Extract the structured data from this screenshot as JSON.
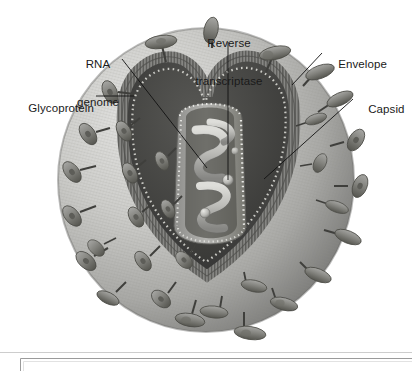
{
  "figure": {
    "name": "virus-structure-diagram",
    "background_color": "#ffffff",
    "line_color": "#111111"
  },
  "labels": [
    {
      "id": "glycoprotein",
      "text": "Glycoprotein",
      "align": "right",
      "x": 12,
      "y": 89,
      "width": 82,
      "leader": {
        "type": "horizontal",
        "x1": 96,
        "y1": 96,
        "x2": 134,
        "y2": 96
      }
    },
    {
      "id": "rna-genome",
      "line1": "RNA",
      "line2": "genome",
      "align": "center",
      "x": 76,
      "y": 33,
      "width": 48,
      "leader": {
        "type": "diagonal",
        "x1": 122,
        "y1": 59,
        "x2": 207,
        "y2": 168
      }
    },
    {
      "id": "reverse-transcriptase",
      "line1": "Reverse",
      "line2": "transcriptase",
      "align": "center",
      "x": 185,
      "y": 12,
      "width": 88,
      "leader": {
        "type": "vertical",
        "x1": 228,
        "y1": 42,
        "x2": 228,
        "y2": 180
      }
    },
    {
      "id": "envelope",
      "text": "Envelope",
      "align": "left",
      "x": 325,
      "y": 45,
      "width": 58,
      "leader": {
        "type": "diagonal",
        "x1": 322,
        "y1": 53,
        "x2": 292,
        "y2": 85
      }
    },
    {
      "id": "capsid",
      "text": "Capsid",
      "align": "left",
      "x": 355,
      "y": 90,
      "width": 44,
      "leader": {
        "type": "diagonal",
        "x1": 353,
        "y1": 99,
        "x2": 264,
        "y2": 179
      }
    }
  ],
  "colors": {
    "sphere_light": "#d8d8d6",
    "sphere_mid": "#b3b3b0",
    "sphere_dark": "#7d7d7a",
    "envelope_band": "#8a8a87",
    "cavity_dark": "#4a4a48",
    "cavity_darkest": "#3b3b39",
    "capsid_wall": "#9a9a97",
    "capsid_dots": "#ebebe8",
    "rna_strand": "#c6c6c2",
    "spike_fill": "#8e8e8b",
    "spike_dark": "#5e5e5c",
    "rule": "#c9c9c9",
    "frame_border": "#9b9b9b",
    "label_text": "#1a1a1a"
  },
  "caption_frame": {
    "x": 20,
    "y": 358,
    "width": 392,
    "height": 13
  },
  "rule": {
    "x": 0,
    "y": 352,
    "width": 412
  },
  "spikes": {
    "count_visible": 34,
    "shape": "mushroom-cap-on-stalk"
  }
}
